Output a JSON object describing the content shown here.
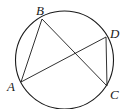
{
  "diagram": {
    "type": "geometry-circle-inscribed-quadrilateral",
    "circle": {
      "cx": 64.5,
      "cy": 60,
      "r": 49
    },
    "points": {
      "A": {
        "x": 21,
        "y": 82,
        "label": "A"
      },
      "B": {
        "x": 42,
        "y": 19,
        "label": "B"
      },
      "C": {
        "x": 107,
        "y": 86,
        "label": "C"
      },
      "D": {
        "x": 106,
        "y": 37,
        "label": "D"
      }
    },
    "segments": [
      "AB",
      "BC",
      "AD",
      "DC"
    ],
    "labels": {
      "A": "A",
      "B": "B",
      "C": "C",
      "D": "D"
    },
    "stroke_color": "#1a1a1a"
  }
}
